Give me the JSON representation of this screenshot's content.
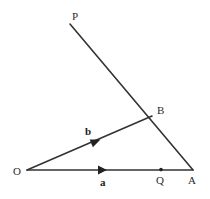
{
  "figure": {
    "type": "geometry-diagram",
    "background_color": "#ffffff",
    "stroke_color": "#333333",
    "label_color": "#2b2b2b",
    "stroke_width": 1.6
  },
  "points": {
    "O": {
      "label": "O",
      "x": 27,
      "y": 170,
      "label_x": 13,
      "label_y": 166
    },
    "A": {
      "label": "A",
      "x": 193,
      "y": 170,
      "label_x": 188,
      "label_y": 175
    },
    "B": {
      "label": "B",
      "x": 152,
      "y": 116,
      "label_x": 157,
      "label_y": 105
    },
    "P": {
      "label": "P",
      "x": 70,
      "y": 24,
      "label_x": 72,
      "label_y": 11
    },
    "Q": {
      "label": "Q",
      "x": 161,
      "y": 170,
      "label_x": 156,
      "label_y": 175,
      "dot": true,
      "dot_radius": 1.8
    }
  },
  "vectors": {
    "a": {
      "label": "a",
      "label_x": 100,
      "label_y": 177,
      "from": "O",
      "to": "A",
      "arrow_x": 103,
      "arrow_y": 170
    },
    "b": {
      "label": "b",
      "label_x": 85,
      "label_y": 126,
      "from": "O",
      "to": "B",
      "arrow_x": 96,
      "arrow_y": 141
    }
  },
  "segments": [
    {
      "name": "ray-OA",
      "x1": 27,
      "y1": 170,
      "x2": 193,
      "y2": 170
    },
    {
      "name": "ray-OB",
      "x1": 27,
      "y1": 170,
      "x2": 152,
      "y2": 116
    },
    {
      "name": "line-PA",
      "x1": 70,
      "y1": 24,
      "x2": 193,
      "y2": 170
    }
  ]
}
